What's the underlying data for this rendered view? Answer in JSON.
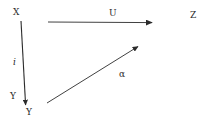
{
  "figure": {
    "type": "commutative-diagram",
    "background_color": "#ffffff",
    "ink_color": "#2b2b2b",
    "width": 202,
    "height": 126
  },
  "nodes": [
    {
      "id": "x",
      "label": "X",
      "x": 13,
      "y": 8
    },
    {
      "id": "z",
      "label": "Z",
      "x": 190,
      "y": 11
    },
    {
      "id": "y",
      "label": "Y",
      "x": 10,
      "y": 92
    },
    {
      "id": "y2",
      "label": "Y",
      "x": 26,
      "y": 108
    }
  ],
  "edges": [
    {
      "id": "u",
      "label": "U",
      "from": "x",
      "to": "z",
      "orientation": "horizontal",
      "label_x": 109,
      "label_y": 9,
      "x1": 48,
      "y1": 22,
      "x2": 157,
      "y2": 23
    },
    {
      "id": "i",
      "label": "i",
      "from": "x",
      "to": "y",
      "orientation": "vertical",
      "label_x": 13,
      "label_y": 58,
      "x1": 21,
      "y1": 21,
      "x2": 26,
      "y2": 110
    },
    {
      "id": "alpha",
      "label": "α",
      "from": "y",
      "to": "u",
      "orientation": "diagonal",
      "label_x": 119,
      "label_y": 70,
      "x1": 47,
      "y1": 103,
      "x2": 142,
      "y2": 44
    }
  ],
  "labels": {
    "node_x": "X",
    "node_z": "Z",
    "node_y": "Y",
    "node_y_secondary": "Y",
    "edge_u": "U",
    "edge_i": "i",
    "edge_alpha": "α"
  }
}
